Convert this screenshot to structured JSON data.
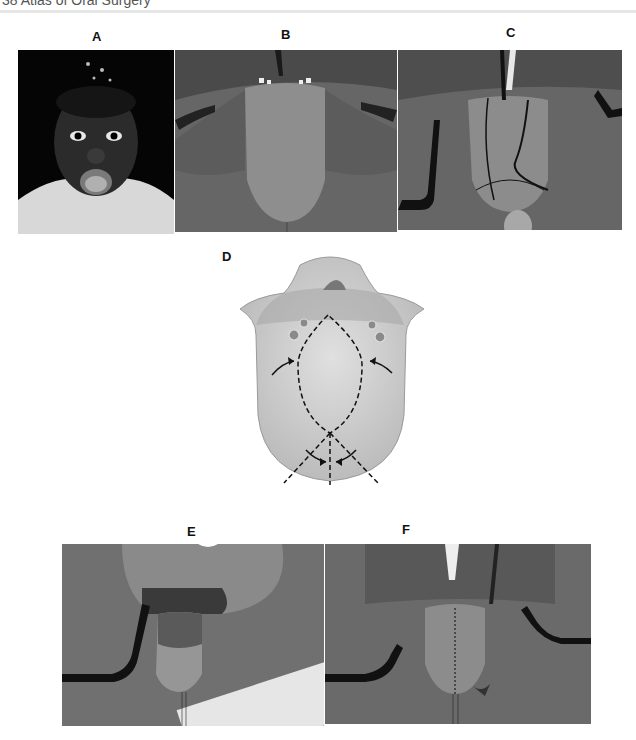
{
  "page": {
    "header_fragment": "38    Atlas of Oral Surgery",
    "figure_type": "multi-panel clinical figure"
  },
  "panels": [
    {
      "label": "A",
      "description": "Frontal photograph of child with open mouth showing macroglossia"
    },
    {
      "label": "B",
      "description": "Intraoperative view of enlarged protruding tongue with retractors"
    },
    {
      "label": "C",
      "description": "Tongue marked with planned incision lines"
    },
    {
      "label": "D",
      "description": "Illustration of tongue with dashed elliptical and wedge excision lines and arrows"
    },
    {
      "label": "E",
      "description": "Intraoperative view after excision with traction suture"
    },
    {
      "label": "F",
      "description": "Final sutured tongue with midline closure"
    }
  ],
  "colors": {
    "background": "#ffffff",
    "label": "#111111",
    "header_rule": "#e6e6e6"
  }
}
